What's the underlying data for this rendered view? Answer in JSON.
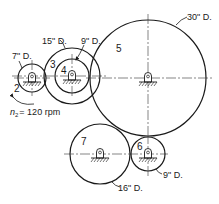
{
  "diagram": {
    "type": "gear-train",
    "gears": [
      {
        "id": "2",
        "label": "2",
        "diameter_label": "7\" D.",
        "cx": 32,
        "cy": 78,
        "r": 14
      },
      {
        "id": "3",
        "label": "3",
        "diameter_label": "15\" D.",
        "cx": 72,
        "cy": 76,
        "r": 28
      },
      {
        "id": "4",
        "label": "4",
        "diameter_label": "9\" D.",
        "cx": 72,
        "cy": 76,
        "r": 17
      },
      {
        "id": "5",
        "label": "5",
        "diameter_label": "30\" D.",
        "cx": 148,
        "cy": 78,
        "r": 58
      },
      {
        "id": "6",
        "label": "6",
        "diameter_label": "9\" D.",
        "cx": 148,
        "cy": 154,
        "r": 17
      },
      {
        "id": "7",
        "label": "7",
        "diameter_label": "16\" D.",
        "cx": 100,
        "cy": 154,
        "r": 30
      }
    ],
    "input_speed": {
      "symbol": "n",
      "subscript": "2",
      "value": "= 120 rpm"
    },
    "colors": {
      "line": "#1a1a1a",
      "background": "#ffffff"
    }
  }
}
